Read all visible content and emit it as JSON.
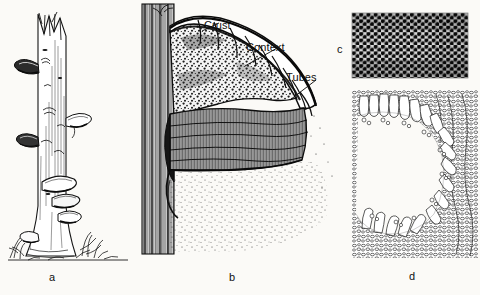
{
  "figure": {
    "background_color": "#fbfaf7",
    "ink_color": "#111111"
  },
  "callouts": [
    {
      "id": "crust",
      "label": "Crust",
      "target": "outer dark upper surface of the bracket"
    },
    {
      "id": "context",
      "label": "Context",
      "target": "fleshy tissue beneath the crust"
    },
    {
      "id": "tubes",
      "label": "Tubes",
      "target": "stratified tube layer under the context"
    }
  ],
  "panels": [
    {
      "id": "a",
      "letter": "a",
      "caption": "Birch snag bearing bracket fungi"
    },
    {
      "id": "b",
      "letter": "b",
      "caption": "Vertical section through the fruit body on the trunk"
    },
    {
      "id": "c",
      "letter": "c",
      "caption": "Pore surface seen from below"
    },
    {
      "id": "d",
      "letter": "d",
      "caption": "Microscopic section of a tube showing basidia and spores"
    }
  ]
}
